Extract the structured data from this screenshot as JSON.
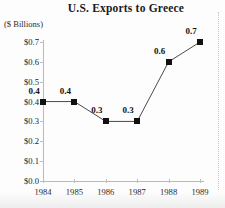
{
  "chart_data": {
    "type": "line",
    "title": "U.S. Exports to Greece",
    "subtitle": "($ Billions)",
    "xlabel": "",
    "ylabel": "($ Billions)",
    "categories": [
      "1984",
      "1985",
      "1986",
      "1987",
      "1988",
      "1989"
    ],
    "values": [
      0.4,
      0.4,
      0.3,
      0.3,
      0.6,
      0.7
    ],
    "point_labels": [
      "0.4",
      "0.4",
      "0.3",
      "0.3",
      "0.6",
      "0.7"
    ],
    "ylim": [
      0.0,
      0.7
    ],
    "y_tick_labels": [
      "$0.7",
      "$0.6",
      "$0.5",
      "$0.4",
      "$0.3",
      "$0.2",
      "$0.1",
      "$0.0"
    ],
    "y_tick_values": [
      0.7,
      0.6,
      0.5,
      0.4,
      0.3,
      0.2,
      0.1,
      0.0
    ],
    "x_tick_labels": [
      "1984",
      "1985",
      "1986",
      "1987",
      "1988",
      "1989"
    ],
    "grid": false,
    "legend": false,
    "marker": "square",
    "series": [
      {
        "name": "U.S. Exports to Greece",
        "values": [
          0.4,
          0.4,
          0.3,
          0.3,
          0.6,
          0.7
        ]
      }
    ],
    "colors": {
      "line": "#4a4a4a",
      "marker": "#111111",
      "axis": "#b9b9b9",
      "text": "#222222",
      "background": "#fdfdfd"
    }
  }
}
